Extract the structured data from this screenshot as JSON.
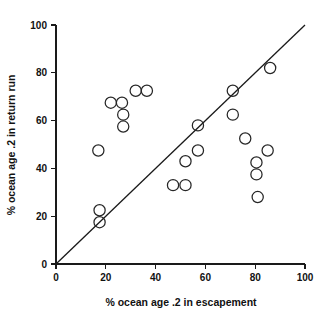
{
  "chart_data": {
    "type": "scatter",
    "title": "",
    "xlabel": "% ocean age .2 in escapement",
    "ylabel": "% ocean age .2 in return run",
    "xlim": [
      0,
      100
    ],
    "ylim": [
      0,
      100
    ],
    "xticks": [
      0,
      20,
      40,
      60,
      80,
      100
    ],
    "yticks": [
      0,
      20,
      40,
      60,
      80,
      100
    ],
    "xtick_labels": [
      "0",
      "20",
      "40",
      "60",
      "80",
      "100"
    ],
    "ytick_labels": [
      "0",
      "20",
      "40",
      "60",
      "80",
      "100"
    ],
    "grid": false,
    "legend": null,
    "marker": "open-circle",
    "reference_line": {
      "name": "1:1 line",
      "from": [
        0,
        0
      ],
      "to": [
        100,
        100
      ]
    },
    "points": [
      {
        "x": 17.5,
        "y": 17.5
      },
      {
        "x": 17.5,
        "y": 22.5
      },
      {
        "x": 17.0,
        "y": 47.5
      },
      {
        "x": 22.0,
        "y": 67.5
      },
      {
        "x": 26.5,
        "y": 67.5
      },
      {
        "x": 27.0,
        "y": 62.5
      },
      {
        "x": 27.0,
        "y": 57.5
      },
      {
        "x": 32.0,
        "y": 72.5
      },
      {
        "x": 36.5,
        "y": 72.5
      },
      {
        "x": 47.0,
        "y": 33.0
      },
      {
        "x": 52.0,
        "y": 33.0
      },
      {
        "x": 52.0,
        "y": 43.0
      },
      {
        "x": 57.0,
        "y": 47.5
      },
      {
        "x": 57.0,
        "y": 58.0
      },
      {
        "x": 71.0,
        "y": 72.5
      },
      {
        "x": 71.0,
        "y": 62.5
      },
      {
        "x": 76.0,
        "y": 52.5
      },
      {
        "x": 80.5,
        "y": 42.5
      },
      {
        "x": 80.5,
        "y": 37.5
      },
      {
        "x": 81.0,
        "y": 28.0
      },
      {
        "x": 85.0,
        "y": 47.5
      },
      {
        "x": 86.0,
        "y": 82.0
      }
    ]
  }
}
